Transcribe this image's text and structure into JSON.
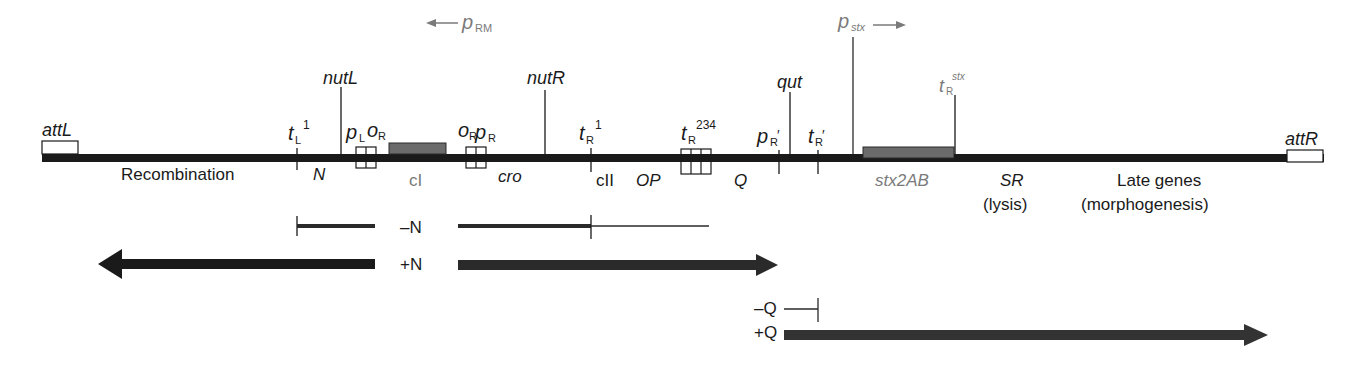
{
  "diagram": {
    "title": "",
    "promoters_top": {
      "p_rm": {
        "base": "p",
        "sub": "RM",
        "direction": "left"
      },
      "p_stx": {
        "base": "p",
        "sub": "stx",
        "direction": "right"
      }
    },
    "sites": {
      "att_l": "attL",
      "att_r": "attR",
      "nut_l": "nutL",
      "nut_r": "nutR",
      "qut": "qut",
      "t_l1": {
        "base": "t",
        "sub": "L",
        "sup": "1"
      },
      "p_l_o_r": {
        "p": "p",
        "p_sub": "L",
        "o": "o",
        "o_sub": "R"
      },
      "o_r_p_r": {
        "o": "o",
        "o_sub": "R",
        "p": "p",
        "p_sub": "R"
      },
      "t_r1": {
        "base": "t",
        "sub": "R",
        "sup": "1"
      },
      "t_r234": {
        "base": "t",
        "sub": "R",
        "sup": "234"
      },
      "p_r_prime": {
        "base": "p",
        "sub": "R",
        "prime": "′"
      },
      "t_r_prime": {
        "base": "t",
        "sub": "R",
        "prime": "′"
      },
      "t_r_stx": {
        "base": "t",
        "sub": "R",
        "sup": "stx"
      }
    },
    "genes": {
      "recombination": "Recombination",
      "n": "N",
      "ci": "cI",
      "cro": "cro",
      "cii": "cII",
      "op": "OP",
      "q": "Q",
      "stx2ab": "stx2AB",
      "sr": "SR",
      "sr_note": "(lysis)",
      "late": "Late genes",
      "late_note": "(morphogenesis)"
    },
    "transcripts": {
      "minus_n": "–N",
      "plus_n": "+N",
      "minus_q": "–Q",
      "plus_q": "+Q"
    },
    "colors": {
      "genome": "#1a1a1a",
      "gene_box": "#6b6b6b",
      "transcript": "#2a2a2a",
      "label_gray": "#7a7a7a"
    }
  }
}
